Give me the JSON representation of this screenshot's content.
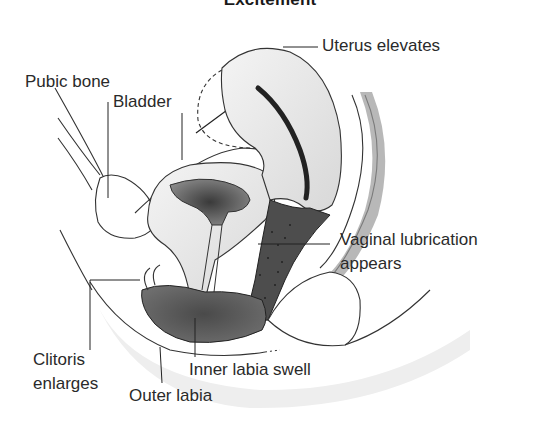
{
  "diagram": {
    "title": "Excitement",
    "labels": {
      "uterus": "Uterus elevates",
      "pubic_bone": "Pubic bone",
      "bladder": "Bladder",
      "vaginal_lubrication_line1": "Vaginal lubrication",
      "vaginal_lubrication_line2": "appears",
      "clitoris_line1": "Clitoris",
      "clitoris_line2": "enlarges",
      "inner_labia": "Inner labia swell",
      "outer_labia": "Outer labia"
    },
    "colors": {
      "line": "#222222",
      "tissue_light": "#ececec",
      "tissue_mid": "#b8b8b8",
      "tissue_dark": "#555555",
      "background": "#ffffff"
    }
  }
}
